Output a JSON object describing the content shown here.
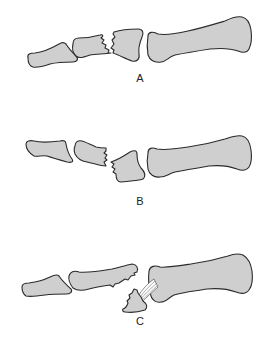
{
  "figure": {
    "panels": [
      {
        "id": "A",
        "label": "A",
        "description": "Middle phalanx fracture, undisplaced"
      },
      {
        "id": "B",
        "label": "B",
        "description": "Middle phalanx fracture, displaced fragment"
      },
      {
        "id": "C",
        "label": "C",
        "description": "Avulsion fragment attached to ligament at proximal phalanx base"
      }
    ],
    "colors": {
      "bone_fill": "#cfcfcf",
      "outline": "#2a2a2a",
      "background": "#ffffff"
    }
  }
}
